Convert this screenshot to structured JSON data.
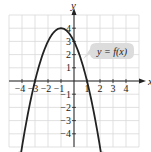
{
  "chart_data": {
    "type": "line",
    "title": "",
    "xlabel": "x",
    "ylabel": "y",
    "xlim": [
      -5,
      5
    ],
    "ylim": [
      -5,
      5
    ],
    "grid": true,
    "x_ticks": [
      -4,
      -3,
      -2,
      -1,
      1,
      2,
      3,
      4
    ],
    "y_ticks": [
      -4,
      -3,
      -2,
      -1,
      1,
      2,
      3,
      4
    ],
    "x_tick_labels": [
      "−4",
      "−3",
      "−2",
      "−1",
      "1",
      "2",
      "3",
      "4"
    ],
    "y_tick_labels": [
      "−4",
      "−3",
      "−2",
      "−1",
      "1",
      "2",
      "3",
      "4"
    ],
    "series": [
      {
        "name": "y = f(x)",
        "label": "y = f(x)",
        "description": "Downward-opening parabola, vertex (-1, 4), x-intercepts -3 and 1, y-intercept 3, arrows at both ends",
        "x": [
          -4.1,
          -4,
          -3,
          -2,
          -1,
          0,
          1,
          2,
          2.1
        ],
        "y": [
          -5.61,
          -5,
          0,
          3,
          4,
          3,
          0,
          -5,
          -5.61
        ],
        "color": "#222222"
      }
    ],
    "annotations": [
      {
        "text": "y = f(x)",
        "x": 2.3,
        "y": 2.3,
        "style": "callout"
      }
    ]
  },
  "labels": {
    "x_axis": "x",
    "y_axis": "y",
    "function": "y = f(x)"
  },
  "colors": {
    "curve": "#222222",
    "axis": "#222222",
    "grid": "#d9d9d9",
    "callout_bg": "#dcdcdc"
  }
}
